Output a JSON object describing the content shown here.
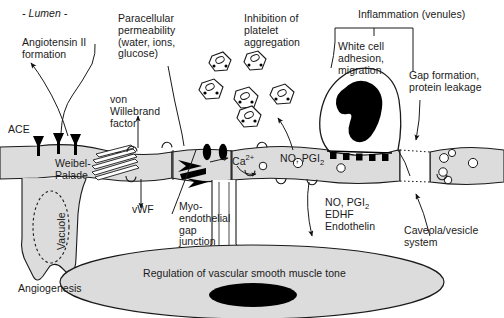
{
  "figure": {
    "type": "biomedical-schematic",
    "colors": {
      "cell_fill": "#dcdcdc",
      "cell_stroke": "#1a1a1a",
      "nucleus_fill": "#000000",
      "muscle_fill": "#dcdcdc",
      "background": "#ffffff",
      "text": "#1a1a1a"
    }
  },
  "labels": {
    "lumen": "- Lumen -",
    "angiotensin": "Angiotensin II\nformation",
    "ace": "ACE",
    "paracellular": "Paracellular\npermeability\n(water, ions,\nglucose)",
    "von_willebrand": "von\nWillebrand\nfactor",
    "vwf": "vWF",
    "weibel_palade": "Weibel-\nPalade",
    "vacuole": "Vacuole",
    "angiogenesis": "Angiogenesis",
    "platelet_inhibition": "Inhibition of\nplatelet\naggregation",
    "inflammation": "Inflammation (venules)",
    "white_cell": "White cell\nadhesion,\nmigration",
    "gap_formation": "Gap formation,\nprotein leakage",
    "myoendothelial": "Myo-\nendothelial\ngap\njunction",
    "caveola": "Caveola/vesicle\nsystem",
    "smooth_muscle": "Regulation of vascular smooth muscle tone"
  },
  "formulas": {
    "calcium": {
      "base": "Ca",
      "sup": "2+"
    },
    "no_pgi2_lumen": {
      "pre": "NO, PGI",
      "sub": "2"
    },
    "no_pgi2_abluminal": {
      "pre": "NO, PGI",
      "sub": "2"
    },
    "edhf": "EDHF",
    "endothelin": "Endothelin"
  },
  "structures": [
    {
      "name": "endothelial-cell-layer",
      "note": "continuous grey band across the vessel"
    },
    {
      "name": "vessel-lumen",
      "note": "white area above the endothelium"
    },
    {
      "name": "smooth-muscle-cell",
      "note": "large grey ellipse with black nucleus"
    },
    {
      "name": "white-blood-cell",
      "note": "leukocyte with lobed black nucleus adhering to endothelium"
    },
    {
      "name": "platelets",
      "count": 6
    },
    {
      "name": "ace-receptors",
      "count": 3
    },
    {
      "name": "adhesion-molecules",
      "count": 6
    },
    {
      "name": "caveolae",
      "count": 6
    },
    {
      "name": "weibel-palade-bodies",
      "count": 6
    },
    {
      "name": "interendothelial-gap",
      "note": "dotted white gap on the right"
    },
    {
      "name": "angiogenic-sprout",
      "note": "descending cell process containing vacuole"
    }
  ]
}
